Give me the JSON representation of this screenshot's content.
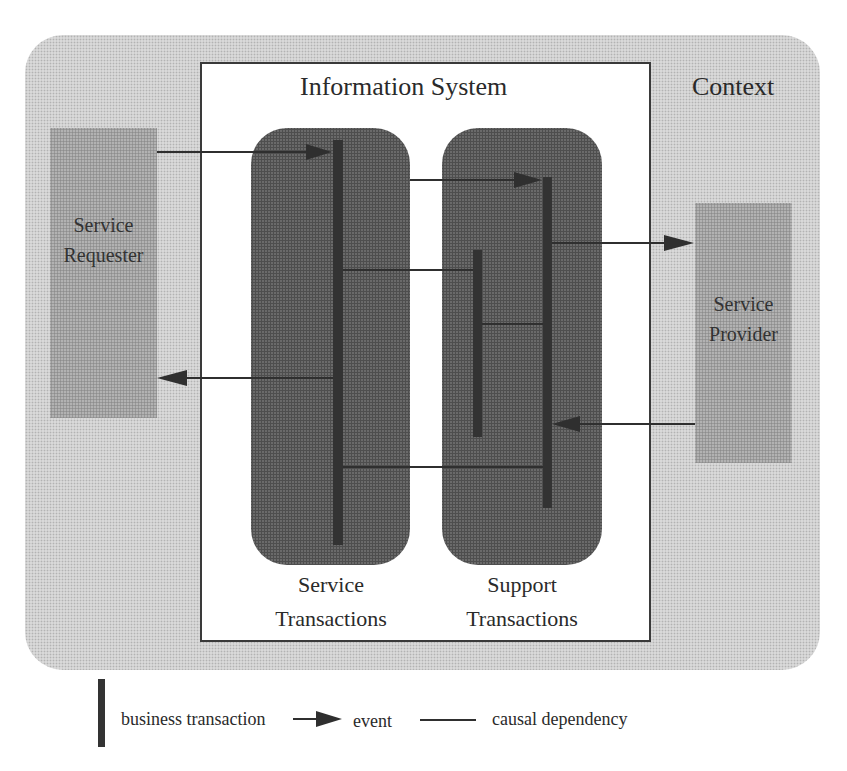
{
  "diagram": {
    "context_label": "Context",
    "information_system_label": "Information System",
    "service_requester": {
      "line1": "Service",
      "line2": "Requester"
    },
    "service_provider": {
      "line1": "Service",
      "line2": "Provider"
    },
    "service_transactions": {
      "line1": "Service",
      "line2": "Transactions"
    },
    "support_transactions": {
      "line1": "Support",
      "line2": "Transactions"
    }
  },
  "legend": {
    "business_transaction": "business transaction",
    "event": "event",
    "causal_dependency": "causal dependency"
  },
  "colors": {
    "context_fill": "#d9d9d9",
    "actor_fill": "#b2b2b2",
    "transaction_group_fill": "#6a6a6a",
    "transaction_bar": "#333333",
    "line": "#2f2f2f",
    "system_box_fill": "#ffffff"
  }
}
